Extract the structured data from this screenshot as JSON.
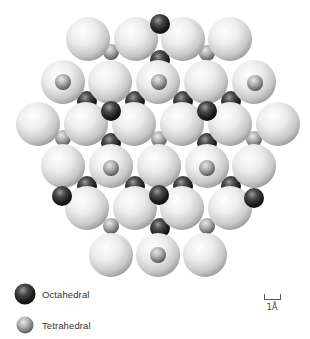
{
  "figure": {
    "colors": {
      "large_atom": "#e6e6e6",
      "octahedral_site": "#1a1a1a",
      "tetrahedral_site": "#9a9a9a",
      "background": "#ffffff"
    },
    "large_atoms": [
      [
        88,
        39
      ],
      [
        136,
        39
      ],
      [
        183,
        39
      ],
      [
        230,
        39
      ],
      [
        63,
        82
      ],
      [
        110,
        82
      ],
      [
        158,
        82
      ],
      [
        206,
        82
      ],
      [
        254,
        82
      ],
      [
        38,
        124
      ],
      [
        86,
        124
      ],
      [
        134,
        124
      ],
      [
        182,
        124
      ],
      [
        230,
        124
      ],
      [
        278,
        124
      ],
      [
        63,
        166
      ],
      [
        111,
        166
      ],
      [
        159,
        166
      ],
      [
        207,
        166
      ],
      [
        254,
        166
      ],
      [
        87,
        208
      ],
      [
        135,
        208
      ],
      [
        182,
        208
      ],
      [
        230,
        208
      ],
      [
        111,
        255
      ],
      [
        158,
        255
      ],
      [
        205,
        255
      ]
    ],
    "octahedral_hidden": [
      [
        160,
        60
      ],
      [
        87,
        101
      ],
      [
        135,
        101
      ],
      [
        183,
        101
      ],
      [
        231,
        101
      ],
      [
        111,
        143
      ],
      [
        207,
        143
      ],
      [
        87,
        186
      ],
      [
        135,
        186
      ],
      [
        183,
        186
      ],
      [
        231,
        186
      ],
      [
        160,
        228
      ]
    ],
    "octahedral_front": [
      [
        160,
        24
      ],
      [
        111,
        111
      ],
      [
        207,
        111
      ],
      [
        62,
        196
      ],
      [
        159,
        195
      ],
      [
        254,
        198
      ]
    ],
    "tetrahedral_hidden": [
      [
        111,
        52
      ],
      [
        207,
        53
      ],
      [
        63,
        138
      ],
      [
        159,
        139
      ],
      [
        254,
        139
      ],
      [
        111,
        226
      ],
      [
        207,
        226
      ]
    ],
    "tetrahedral_on_top": [
      [
        63,
        82
      ],
      [
        159,
        82
      ],
      [
        255,
        83
      ],
      [
        111,
        168
      ],
      [
        207,
        168
      ],
      [
        158,
        255
      ]
    ]
  },
  "legend": {
    "items": [
      {
        "label": "Octahedral",
        "icon": "dark-sphere-icon"
      },
      {
        "label": "Tetrahedral",
        "icon": "light-sphere-icon"
      }
    ]
  },
  "scale_bar": {
    "label": "1Å"
  }
}
